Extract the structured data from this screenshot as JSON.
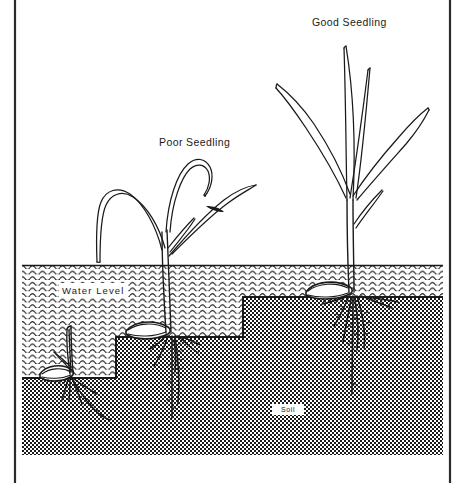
{
  "figure": {
    "width": 467,
    "height": 483,
    "background_color": "#ffffff",
    "ink_color": "#1a1a1a"
  },
  "frame": {
    "left_rule_x": 14,
    "right_rule_x": 450,
    "rule_color": "#2b2b2b",
    "rule_width": 2
  },
  "labels": {
    "good_seedling": "Good Seedling",
    "poor_seedling": "Poor Seedling",
    "water_level": "Water  Level",
    "soil": "Soil"
  },
  "scene": {
    "water": {
      "name": "water-layer",
      "pattern": "wavy-scallop-lines",
      "left": 22,
      "right": 443,
      "top": 265,
      "bottom": 455,
      "row_spacing_px": 5.6
    },
    "soil": {
      "name": "soil-layer",
      "pattern": "checkerboard-stipple",
      "left": 22,
      "right": 443,
      "bottom": 455,
      "cell_size_px": 2,
      "steps": [
        {
          "x_start": 22,
          "x_end": 116,
          "top_y": 378
        },
        {
          "x_start": 116,
          "x_end": 243,
          "top_y": 337
        },
        {
          "x_start": 243,
          "x_end": 443,
          "top_y": 297
        }
      ]
    },
    "seedlings": [
      {
        "id": "submerged-seedling",
        "label": null,
        "quality": "submerged",
        "seed_x": 63,
        "seed_y": 375,
        "shoot_top_y": 325,
        "leaf_count": 2,
        "root_depth_px": 40,
        "description": "Seedling buried at deepest soil step, shoot entirely below water level"
      },
      {
        "id": "poor-seedling",
        "label": "Poor Seedling",
        "quality": "poor",
        "seed_x": 165,
        "seed_y": 332,
        "shoot_top_y": 160,
        "leaf_count": 4,
        "root_depth_px": 95,
        "description": "Seedling on middle soil step with long drooping arched leaves"
      },
      {
        "id": "good-seedling",
        "label": "Good Seedling",
        "quality": "good",
        "seed_x": 352,
        "seed_y": 293,
        "shoot_top_y": 45,
        "leaf_count": 4,
        "root_depth_px": 120,
        "description": "Seedling at shallow soil step with upright vigorous leaves and deep roots"
      }
    ]
  }
}
